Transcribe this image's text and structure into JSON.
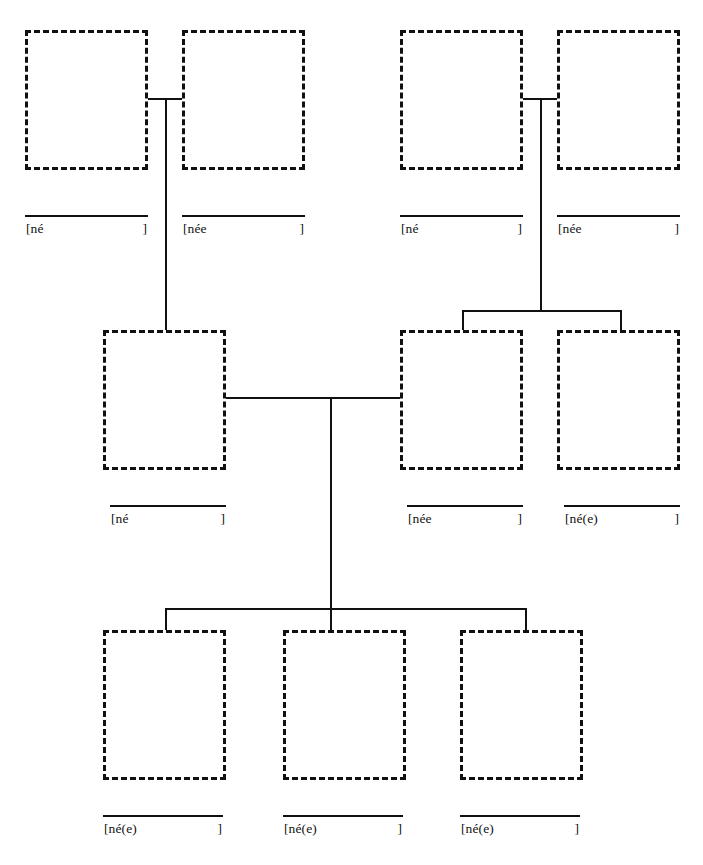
{
  "document": {
    "title": "Family Tree Worksheet",
    "type": "genealogy-chart",
    "ink_color": "#111111",
    "background_color": "#ffffff",
    "box_style": "dashed",
    "generations": 3
  },
  "labels": {
    "born_male": "[né",
    "born_female": "[née",
    "born_either": "[né(e)",
    "bracket_close": "]"
  },
  "generation1": {
    "name": "grandparents",
    "people": [
      {
        "id": "g1-p1",
        "role": "paternal-grandfather",
        "born_label": "[né",
        "bracket_close": "]",
        "box": {
          "x": 25,
          "y": 30,
          "w": 123,
          "h": 140
        },
        "rule": {
          "x": 25,
          "y": 215,
          "w": 123
        }
      },
      {
        "id": "g1-p2",
        "role": "paternal-grandmother",
        "born_label": "[née",
        "bracket_close": "]",
        "box": {
          "x": 182,
          "y": 30,
          "w": 123,
          "h": 140
        },
        "rule": {
          "x": 182,
          "y": 215,
          "w": 123
        }
      },
      {
        "id": "g1-p3",
        "role": "maternal-grandfather",
        "born_label": "[né",
        "bracket_close": "]",
        "box": {
          "x": 400,
          "y": 30,
          "w": 123,
          "h": 140
        },
        "rule": {
          "x": 400,
          "y": 215,
          "w": 123
        }
      },
      {
        "id": "g1-p4",
        "role": "maternal-grandmother",
        "born_label": "[née",
        "bracket_close": "]",
        "box": {
          "x": 557,
          "y": 30,
          "w": 123,
          "h": 140
        },
        "rule": {
          "x": 557,
          "y": 215,
          "w": 123
        }
      }
    ]
  },
  "generation2": {
    "name": "parents-and-aunt-uncle",
    "people": [
      {
        "id": "g2-p1",
        "role": "father",
        "born_label": "[né",
        "bracket_close": "]",
        "box": {
          "x": 103,
          "y": 330,
          "w": 123,
          "h": 140
        },
        "rule": {
          "x": 110,
          "y": 505,
          "w": 116
        }
      },
      {
        "id": "g2-p2",
        "role": "mother",
        "born_label": "[née",
        "bracket_close": "]",
        "box": {
          "x": 400,
          "y": 330,
          "w": 123,
          "h": 140
        },
        "rule": {
          "x": 407,
          "y": 505,
          "w": 116
        }
      },
      {
        "id": "g2-p3",
        "role": "aunt-or-uncle",
        "born_label": "[né(e)",
        "bracket_close": "]",
        "box": {
          "x": 557,
          "y": 330,
          "w": 123,
          "h": 140
        },
        "rule": {
          "x": 564,
          "y": 505,
          "w": 116
        }
      }
    ]
  },
  "generation3": {
    "name": "children",
    "people": [
      {
        "id": "g3-p1",
        "role": "child-1",
        "born_label": "[né(e)",
        "bracket_close": "]",
        "box": {
          "x": 103,
          "y": 630,
          "w": 123,
          "h": 150
        },
        "rule": {
          "x": 103,
          "y": 815,
          "w": 120
        }
      },
      {
        "id": "g3-p2",
        "role": "child-2",
        "born_label": "[né(e)",
        "bracket_close": "]",
        "box": {
          "x": 283,
          "y": 630,
          "w": 123,
          "h": 150
        },
        "rule": {
          "x": 283,
          "y": 815,
          "w": 120
        }
      },
      {
        "id": "g3-p3",
        "role": "child-3",
        "born_label": "[né(e)",
        "bracket_close": "]",
        "box": {
          "x": 460,
          "y": 630,
          "w": 123,
          "h": 150
        },
        "rule": {
          "x": 460,
          "y": 815,
          "w": 120
        }
      }
    ]
  },
  "connectors": {
    "marriage_bars": [
      {
        "id": "m1",
        "name": "paternal-grandparents-marriage",
        "x": 148,
        "y": 98,
        "w": 34
      },
      {
        "id": "m2",
        "name": "maternal-grandparents-marriage",
        "x": 523,
        "y": 98,
        "w": 34
      },
      {
        "id": "m3",
        "name": "parents-marriage",
        "x": 226,
        "y": 397,
        "w": 174
      }
    ],
    "descent_lines": [
      {
        "id": "d1",
        "name": "paternal-descent",
        "x": 165,
        "y": 98,
        "h": 232
      },
      {
        "id": "d2",
        "name": "maternal-descent",
        "x": 540,
        "y": 98,
        "h": 212
      },
      {
        "id": "d3",
        "name": "parents-descent",
        "x": 330,
        "y": 397,
        "h": 211
      }
    ],
    "sibling_brackets": [
      {
        "id": "s1",
        "name": "maternal-siblings-bracket",
        "bar": {
          "x": 462,
          "y": 310,
          "w": 158
        },
        "drops": [
          {
            "x": 462,
            "y": 310,
            "h": 20
          },
          {
            "x": 620,
            "y": 310,
            "h": 20
          }
        ]
      },
      {
        "id": "s2",
        "name": "children-bracket",
        "bar": {
          "x": 165,
          "y": 608,
          "w": 360
        },
        "drops": [
          {
            "x": 165,
            "y": 608,
            "h": 22
          },
          {
            "x": 330,
            "y": 608,
            "h": 22
          },
          {
            "x": 525,
            "y": 608,
            "h": 22
          }
        ]
      }
    ]
  }
}
